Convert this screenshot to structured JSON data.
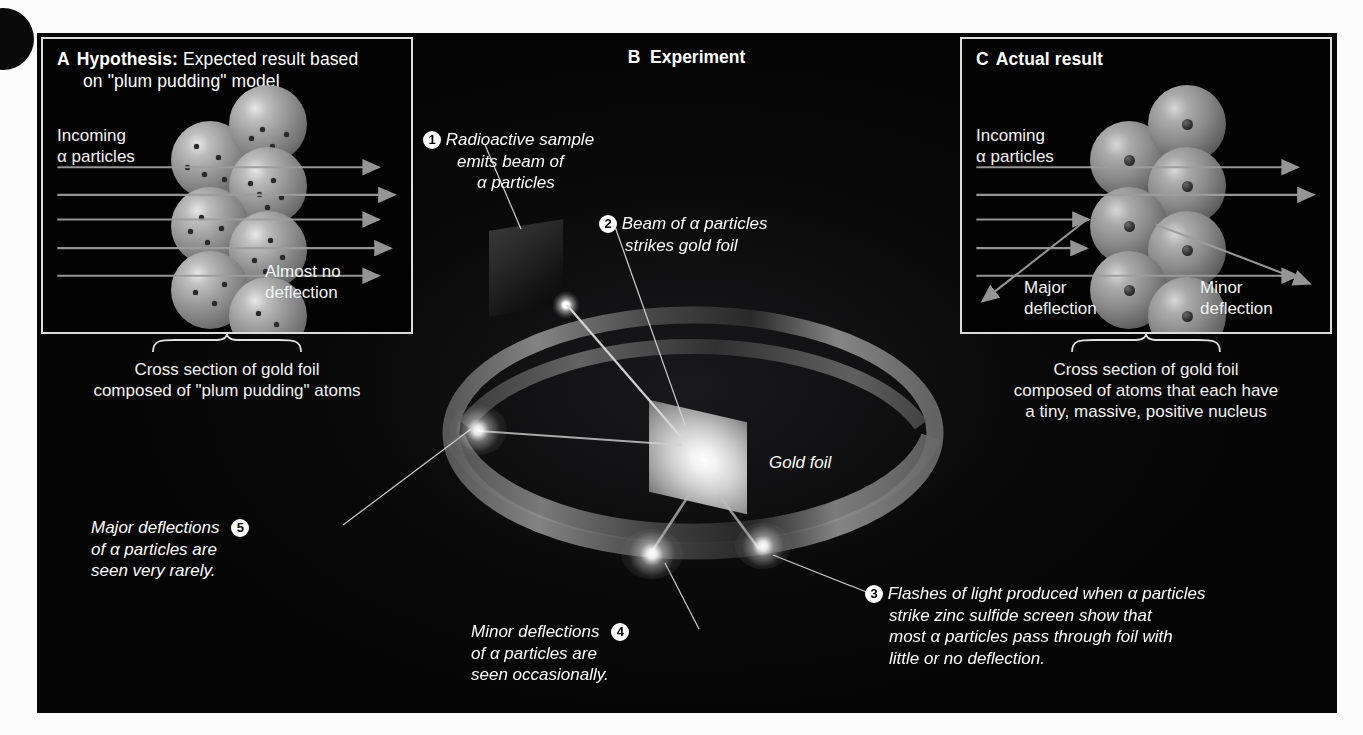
{
  "figure": {
    "panels": [
      {
        "id": "A",
        "tag": "A",
        "title_bold": "Hypothesis:",
        "title_rest": "Expected result based",
        "title_line2": "on \"plum pudding\" model",
        "incoming_label_line1": "Incoming",
        "incoming_label_line2": "α particles",
        "result_label_line1": "Almost no",
        "result_label_line2": "deflection",
        "caption_line1": "Cross section of gold foil",
        "caption_line2": "composed of \"plum pudding\" atoms",
        "beam_count": 5,
        "atom_count": 8
      },
      {
        "id": "B",
        "tag": "B",
        "title": "Experiment",
        "foil_label": "Gold foil",
        "callouts": [
          {
            "number": "1",
            "lines": [
              "Radioactive sample",
              "emits beam of",
              "α particles"
            ]
          },
          {
            "number": "2",
            "lines": [
              "Beam of α particles",
              "strikes gold foil"
            ]
          },
          {
            "number": "3",
            "lines": [
              "Flashes of light produced when α particles",
              "strike zinc sulfide screen show that",
              "most α particles pass through foil with",
              "little or no deflection."
            ]
          },
          {
            "number": "4",
            "lines": [
              "Minor deflections",
              "of α particles are",
              "seen occasionally."
            ]
          },
          {
            "number": "5",
            "lines": [
              "Major deflections",
              "of α particles are",
              "seen very rarely."
            ]
          }
        ]
      },
      {
        "id": "C",
        "tag": "C",
        "title": "Actual result",
        "incoming_label_line1": "Incoming",
        "incoming_label_line2": "α particles",
        "major_label_line1": "Major",
        "major_label_line2": "deflection",
        "minor_label_line1": "Minor",
        "minor_label_line2": "deflection",
        "caption_line1": "Cross section of gold foil",
        "caption_line2": "composed of atoms that each have",
        "caption_line3": "a tiny, massive, positive nucleus",
        "beam_count": 5,
        "atom_count": 8
      }
    ]
  },
  "colors": {
    "background": "#050505",
    "text": "#f2f2f2",
    "border": "#dcdcdc",
    "badge_fill": "#ffffff",
    "badge_text": "#000000",
    "arrow": "#9a9a9a",
    "foil_highlight": "#ffffff"
  }
}
